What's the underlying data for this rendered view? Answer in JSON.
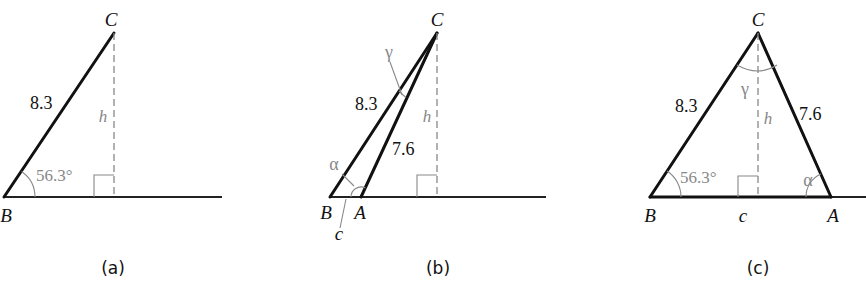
{
  "figure": {
    "panels": [
      {
        "id": "a",
        "caption": "(a)",
        "vertices": {
          "B": "B",
          "C": "C"
        },
        "side_BC": "8.3",
        "height": "h",
        "angle_B": "56.3°"
      },
      {
        "id": "b",
        "caption": "(b)",
        "vertices": {
          "A": "A",
          "B": "B",
          "C": "C"
        },
        "side_BC": "8.3",
        "side_AC": "7.6",
        "side_AB": "c",
        "height": "h",
        "angle_alpha": "α",
        "angle_gamma": "γ"
      },
      {
        "id": "c",
        "caption": "(c)",
        "vertices": {
          "A": "A",
          "B": "B",
          "C": "C"
        },
        "side_BC": "8.3",
        "side_AC": "7.6",
        "side_AB": "c",
        "height": "h",
        "angle_B": "56.3°",
        "angle_alpha": "α",
        "angle_gamma": "γ"
      }
    ]
  }
}
